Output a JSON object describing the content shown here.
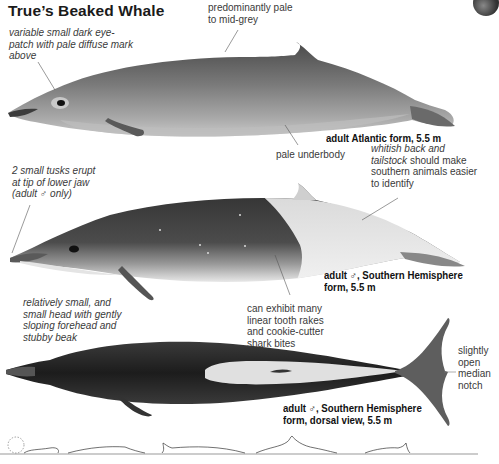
{
  "page": {
    "title": "True’s Beaked Whale"
  },
  "annotations": {
    "eye_patch": "variable small dark eye-patch with pale diffuse mark above",
    "colour": "predominantly pale to mid-grey",
    "underbody": "pale underbody",
    "back_prefix": "whitish back and tailstock",
    "back_suffix": " should make southern animals easier to identify",
    "tusks": "2 small tusks erupt at tip of lower jaw (adult ♂ only)",
    "head": "relatively small, and small head with gently sloping forehead and stubby beak",
    "scars": "can exhibit many linear tooth rakes and cookie-cutter shark bites",
    "notch": "slightly open median notch"
  },
  "captions": {
    "atlantic": "adult Atlantic form, 5.5 m",
    "southern_line1": "adult ♂, Southern Hemisphere",
    "southern_line2": "form, 5.5 m",
    "dorsal_line1": "adult ♂, Southern Hemisphere",
    "dorsal_line2": "form, dorsal view, 5.5 m"
  },
  "illustrations": [
    {
      "name": "atlantic-form-lateral",
      "palette": {
        "body": "#7d7d7d",
        "belly": "#b5b5b5"
      }
    },
    {
      "name": "southern-form-lateral",
      "palette": {
        "dark": "#3e3e3e",
        "pale": "#e6e6e6"
      }
    },
    {
      "name": "southern-form-dorsal",
      "palette": {
        "dark": "#2a2a2a",
        "pale": "#e2e2e2"
      }
    }
  ],
  "surfacing_sequence": {
    "count": 5,
    "blow": "dashed circle"
  }
}
